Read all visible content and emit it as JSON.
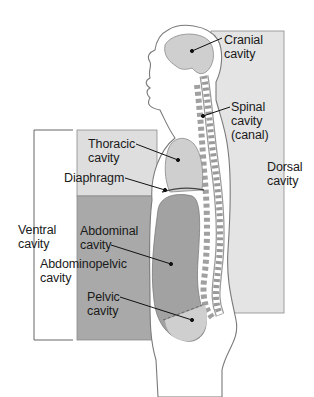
{
  "diagram": {
    "type": "anatomical-diagram",
    "labels": {
      "cranial": "Cranial\ncavity",
      "spinal": "Spinal\ncavity\n(canal)",
      "dorsal": "Dorsal\ncavity",
      "thoracic": "Thoracic\ncavity",
      "diaphragm": "Diaphragm",
      "ventral": "Ventral\ncavity",
      "abdominal": "Abdominal\ncavity",
      "abdominopelvic": "Abdominopelvic\ncavity",
      "pelvic": "Pelvic\ncavity"
    },
    "colors": {
      "dorsal_region": "#e4e4e4",
      "thoracic_region": "#dedede",
      "abdominopelvic_region": "#a9a9a9",
      "body_fill": "#ffffff",
      "body_outline": "#7a7a7a",
      "organ_light": "#cfcfcf",
      "organ_dark": "#a2a2a2",
      "leader_line": "#111111"
    }
  }
}
